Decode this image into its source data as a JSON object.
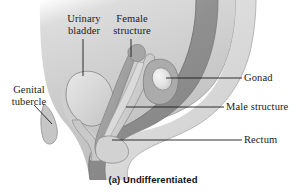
{
  "figure": {
    "caption": "(a) Undifferentiated"
  },
  "labels": {
    "urinary_bladder": "Urinary\nbladder",
    "female_structure": "Female\nstructure",
    "genital_tubercle": "Genital\ntubercle",
    "gonad": "Gonad",
    "male_structure": "Male structure",
    "rectum": "Rectum"
  },
  "colors": {
    "background": "#ffffff",
    "body_tissue_light": "#d4d4d4",
    "body_tissue_mid": "#c2c2c2",
    "body_tissue_shadow": "#b0b0b0",
    "duct_light": "#dcdcdc",
    "duct_mid": "#bdbdbd",
    "rectum_dark": "#8e8e8e",
    "rectum_darker": "#7d7d7d",
    "gonad_highlight": "#ededed",
    "outline": "#6e6e6e",
    "leader_line": "#1a1a1a",
    "text": "#1a1a1a"
  }
}
